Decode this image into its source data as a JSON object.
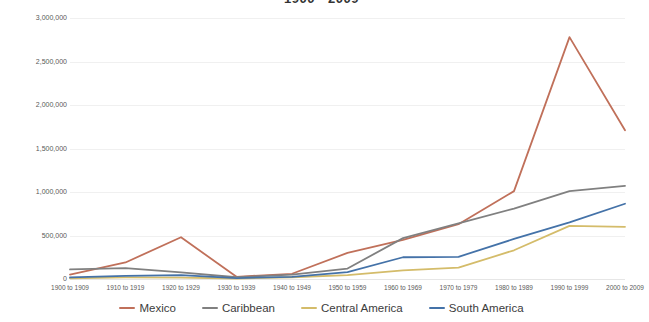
{
  "chart_data": {
    "type": "line",
    "title": "1900 - 2009",
    "xlabel": "",
    "ylabel": "",
    "ylim": [
      0,
      3000000
    ],
    "ytick_step": 500000,
    "grid": true,
    "legend_position": "bottom",
    "categories": [
      "1900 to 1909",
      "1910 to 1919",
      "1920 to 1929",
      "1930 to 1939",
      "1940 to 1949",
      "1950 to 1959",
      "1960 to 1969",
      "1970 to 1979",
      "1980 to 1989",
      "1990 to 1999",
      "2000 to 2009"
    ],
    "ytick_labels": [
      "0",
      "500,000",
      "1,000,000",
      "1,500,000",
      "2,000,000",
      "2,500,000",
      "3,000,000"
    ],
    "series": [
      {
        "name": "Mexico",
        "color": "#C0705A",
        "values": [
          50000,
          190000,
          480000,
          25000,
          60000,
          300000,
          450000,
          630000,
          1010000,
          2780000,
          1710000
        ]
      },
      {
        "name": "Caribbean",
        "color": "#808080",
        "values": [
          110000,
          125000,
          75000,
          20000,
          50000,
          120000,
          470000,
          640000,
          810000,
          1010000,
          1070000
        ]
      },
      {
        "name": "Central America",
        "color": "#D4BC6A",
        "values": [
          8000,
          18000,
          16000,
          6000,
          20000,
          45000,
          100000,
          130000,
          330000,
          610000,
          600000
        ]
      },
      {
        "name": "South America",
        "color": "#4472A8",
        "values": [
          18000,
          35000,
          45000,
          10000,
          25000,
          80000,
          250000,
          255000,
          460000,
          650000,
          865000
        ]
      }
    ]
  },
  "legend": {
    "items": [
      {
        "label": "Mexico"
      },
      {
        "label": "Caribbean"
      },
      {
        "label": "Central America"
      },
      {
        "label": "South America"
      }
    ]
  }
}
